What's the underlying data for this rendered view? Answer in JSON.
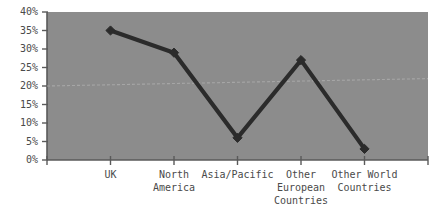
{
  "chart_data": {
    "type": "line",
    "title": "",
    "subtitle": "",
    "xlabel": "",
    "ylabel": "",
    "categories": [
      "UK",
      "North\nAmerica",
      "Asia/Pacific",
      "Other\nEuropean\nCountries",
      "Other World\nCountries"
    ],
    "values": [
      35,
      29,
      6,
      27,
      3
    ],
    "value_labels": [
      "35%",
      "29%",
      "6%",
      "27%",
      "3%"
    ],
    "series": [
      {
        "name": "Share",
        "values": [
          35,
          29,
          6,
          27,
          3
        ],
        "color": "#2b2b2b",
        "marker": "diamond"
      },
      {
        "name": "Trend",
        "values": [
          20,
          20.5,
          21,
          21.5,
          22
        ],
        "color": "#a6a6a6",
        "marker": "none",
        "style": "dashed-faint"
      }
    ],
    "ylim": [
      0,
      40
    ],
    "ytick_values": [
      0,
      5,
      10,
      15,
      20,
      25,
      30,
      35,
      40
    ],
    "ytick_labels": [
      "0%",
      "5%",
      "10%",
      "15%",
      "20%",
      "25%",
      "30%",
      "35%",
      "40%"
    ],
    "grid": false,
    "legend": "none",
    "legend_position": "none",
    "plot_background_color": "#8c8c8c",
    "figure_background_color": "#ffffff",
    "axis_color": "#5a5a5a",
    "text_color": "#4a4a4a"
  }
}
